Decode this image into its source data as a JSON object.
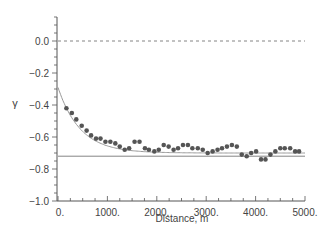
{
  "chart_data": {
    "type": "scatter",
    "title": "",
    "xlabel": "Distance, m",
    "ylabel": "γ",
    "xlim": [
      0,
      5000
    ],
    "ylim": [
      -1.0,
      0.0
    ],
    "ymax_axis": 0.15,
    "xticks": [
      0,
      1000,
      2000,
      3000,
      4000,
      5000
    ],
    "xtick_labels": [
      "0.",
      "1000.",
      "2000.",
      "3000.",
      "4000.",
      "5000."
    ],
    "yticks": [
      0.0,
      -0.2,
      -0.4,
      -0.6,
      -0.8,
      -1.0
    ],
    "ytick_labels": [
      "0.0",
      "−0.2",
      "−0.4",
      "−0.6",
      "−0.8",
      "−1.0"
    ],
    "grid": false,
    "reference_lines": [
      {
        "name": "zero-line",
        "y": 0.0,
        "style": "dashed"
      },
      {
        "name": "asymptote-line",
        "y": -0.72,
        "style": "solid"
      }
    ],
    "fit_curve": {
      "name": "exponential-fit",
      "start": -0.29,
      "asymptote": -0.7,
      "decay_m": 450
    },
    "series": [
      {
        "name": "observed",
        "x": [
          170,
          280,
          370,
          480,
          580,
          670,
          770,
          860,
          960,
          1060,
          1160,
          1250,
          1350,
          1440,
          1550,
          1650,
          1760,
          1840,
          1950,
          2040,
          2140,
          2240,
          2340,
          2430,
          2530,
          2630,
          2720,
          2830,
          2930,
          3030,
          3130,
          3230,
          3320,
          3420,
          3520,
          3620,
          3720,
          3820,
          3910,
          4010,
          4110,
          4200,
          4300,
          4400,
          4500,
          4590,
          4700,
          4800,
          4880
        ],
        "y": [
          -0.42,
          -0.45,
          -0.49,
          -0.53,
          -0.56,
          -0.59,
          -0.61,
          -0.61,
          -0.63,
          -0.63,
          -0.64,
          -0.66,
          -0.68,
          -0.67,
          -0.63,
          -0.63,
          -0.67,
          -0.68,
          -0.69,
          -0.68,
          -0.65,
          -0.66,
          -0.68,
          -0.67,
          -0.65,
          -0.65,
          -0.67,
          -0.67,
          -0.68,
          -0.7,
          -0.69,
          -0.68,
          -0.67,
          -0.66,
          -0.65,
          -0.66,
          -0.71,
          -0.72,
          -0.7,
          -0.69,
          -0.74,
          -0.74,
          -0.71,
          -0.69,
          -0.67,
          -0.67,
          -0.67,
          -0.69,
          -0.69
        ]
      }
    ]
  }
}
